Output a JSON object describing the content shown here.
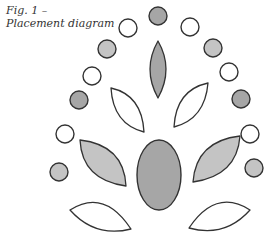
{
  "caption": {
    "line1": "Fig. 1 –",
    "line2": "Placement diagram"
  },
  "colors": {
    "stroke": "#333333",
    "white": "#ffffff",
    "light_gray": "#c4c4c4",
    "dark_gray": "#a6a6a6"
  },
  "diagram": {
    "circles": [
      {
        "id": "top-dark",
        "cx": 158,
        "cy": 16,
        "r": 9,
        "fill": "dark_gray"
      },
      {
        "id": "arc-left-1-white",
        "cx": 128,
        "cy": 28,
        "r": 9,
        "fill": "white"
      },
      {
        "id": "arc-left-2-light",
        "cx": 107,
        "cy": 49,
        "r": 9,
        "fill": "light_gray"
      },
      {
        "id": "arc-left-3-white",
        "cx": 92,
        "cy": 76,
        "r": 9,
        "fill": "white"
      },
      {
        "id": "arc-left-4-dark",
        "cx": 79,
        "cy": 100,
        "r": 9,
        "fill": "dark_gray"
      },
      {
        "id": "arc-left-5-white",
        "cx": 65,
        "cy": 134,
        "r": 9,
        "fill": "white"
      },
      {
        "id": "arc-left-6-light",
        "cx": 59,
        "cy": 172,
        "r": 9,
        "fill": "light_gray"
      },
      {
        "id": "arc-right-1-white",
        "cx": 190,
        "cy": 27,
        "r": 9,
        "fill": "white"
      },
      {
        "id": "arc-right-2-light",
        "cx": 213,
        "cy": 48,
        "r": 9,
        "fill": "light_gray"
      },
      {
        "id": "arc-right-3-white",
        "cx": 229,
        "cy": 72,
        "r": 9,
        "fill": "white"
      },
      {
        "id": "arc-right-4-dark",
        "cx": 241,
        "cy": 99,
        "r": 9,
        "fill": "dark_gray"
      },
      {
        "id": "arc-right-5-white",
        "cx": 250,
        "cy": 134,
        "r": 9,
        "fill": "white"
      },
      {
        "id": "arc-right-6-light",
        "cx": 254,
        "cy": 168,
        "r": 9,
        "fill": "light_gray"
      }
    ],
    "leaves": [
      {
        "id": "center-top-dark",
        "d": "M158,41 Q174,69 158,98 Q142,69 158,41 Z",
        "fill": "dark_gray"
      },
      {
        "id": "upper-left-white",
        "d": "M111,88 Q142,95 144,132 Q113,124 111,88 Z",
        "fill": "white"
      },
      {
        "id": "upper-right-white",
        "d": "M208,83 Q176,90 174,127 Q205,119 208,83 Z",
        "fill": "white"
      },
      {
        "id": "mid-left-light",
        "d": "M80,140 Q124,145 126,186 Q82,180 80,140 Z",
        "fill": "light_gray"
      },
      {
        "id": "mid-right-light",
        "d": "M240,136 Q196,141 193,182 Q237,176 240,136 Z",
        "fill": "light_gray"
      },
      {
        "id": "bottom-left-white",
        "d": "M70,210 Q104,188 131,229 Q95,238 70,210 Z",
        "fill": "white"
      },
      {
        "id": "bottom-right-white",
        "d": "M250,210 Q216,188 189,228 Q225,238 250,210 Z",
        "fill": "white"
      }
    ],
    "ellipses": [
      {
        "id": "center-oval-dark",
        "cx": 159,
        "cy": 175,
        "rx": 22,
        "ry": 35,
        "fill": "dark_gray"
      }
    ]
  }
}
